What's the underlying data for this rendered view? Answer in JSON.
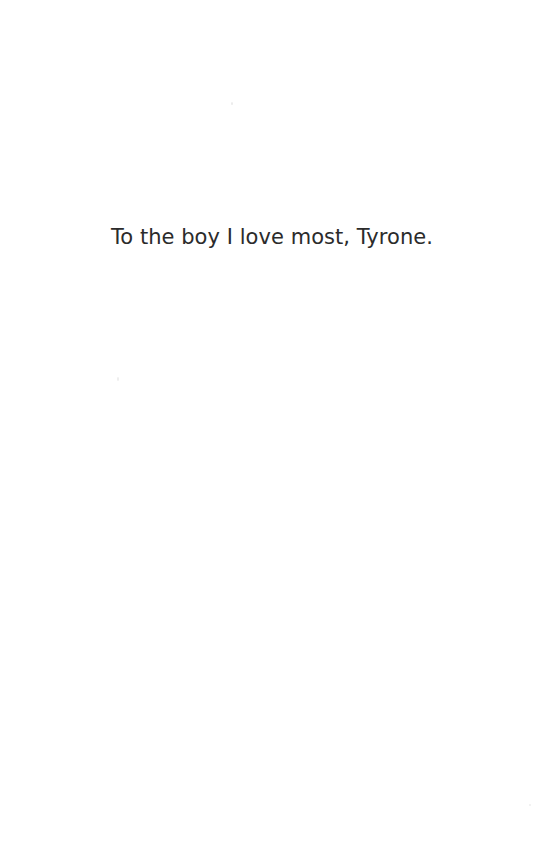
{
  "page": {
    "type": "book-dedication-page",
    "background_color": "#ffffff",
    "width": 544,
    "height": 866
  },
  "dedication": {
    "text": "To the boy I love most, Tyrone.",
    "text_color": "#2b2b2b",
    "alignment": "center",
    "font_size_px": 21
  },
  "artifacts": {
    "speck_a_label": "",
    "speck_b_label": "",
    "speck_c_label": ""
  }
}
